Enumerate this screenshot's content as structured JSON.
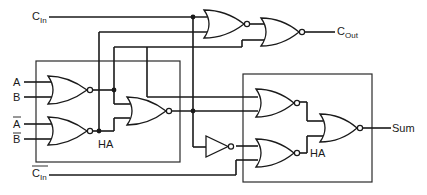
{
  "diagram": {
    "type": "logic-circuit",
    "inputs": {
      "c_in": {
        "base": "C",
        "sub": "In",
        "inverted": false
      },
      "a": {
        "text": "A",
        "inverted": false
      },
      "b": {
        "text": "B",
        "inverted": false
      },
      "a_bar": {
        "text": "A",
        "inverted": true
      },
      "b_bar": {
        "text": "B",
        "inverted": true
      },
      "c_in_bar": {
        "base": "C",
        "sub": "In",
        "inverted": true
      }
    },
    "outputs": {
      "c_out": {
        "base": "C",
        "sub": "Out"
      },
      "sum": {
        "text": "Sum"
      }
    },
    "blocks": [
      {
        "id": "ha-left",
        "label": "HA"
      },
      {
        "id": "ha-right",
        "label": "HA"
      }
    ],
    "gates": [
      {
        "id": "nor-ab",
        "type": "NOR",
        "block": "ha-left"
      },
      {
        "id": "nor-abar-bbar",
        "type": "NOR",
        "block": "ha-left"
      },
      {
        "id": "nor-ha1-out",
        "type": "NOR",
        "block": "ha-left"
      },
      {
        "id": "nor-right-top",
        "type": "NOR",
        "block": "ha-right"
      },
      {
        "id": "inverter",
        "type": "NOT",
        "block": "ha-right"
      },
      {
        "id": "nor-right-bottom",
        "type": "NOR",
        "block": "ha-right"
      },
      {
        "id": "nor-sum",
        "type": "NOR",
        "block": "ha-right"
      },
      {
        "id": "nor-carry-1",
        "type": "NOR",
        "block": null
      },
      {
        "id": "nor-carry-out",
        "type": "NOR",
        "block": null
      }
    ]
  }
}
